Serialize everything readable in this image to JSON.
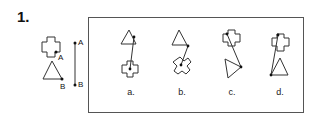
{
  "question": {
    "number": "1.",
    "stem": {
      "point_labels": [
        "A",
        "B"
      ],
      "segment_labels": [
        "A",
        "B"
      ],
      "shapes": [
        "cross-shape",
        "triangle"
      ]
    },
    "options": [
      {
        "label": "a.",
        "description": "triangle above cross, segment from triangle edge to cross center"
      },
      {
        "label": "b.",
        "description": "triangle above rotated cross, segment from triangle vertex to cross center"
      },
      {
        "label": "c.",
        "description": "cross above rotated triangle, segment from cross to triangle vertex"
      },
      {
        "label": "d.",
        "description": "cross above triangle, segment from cross top to triangle vertex"
      }
    ]
  }
}
